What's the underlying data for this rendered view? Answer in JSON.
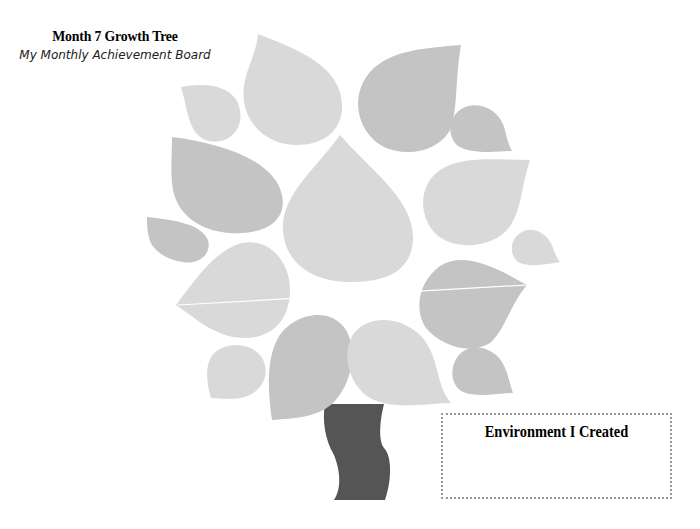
{
  "header": {
    "title": "Month 7 Growth Tree",
    "subtitle": "My Monthly Achievement Board"
  },
  "tree": {
    "leaf_colors": {
      "light": "#d9d9d9",
      "dark": "#c4c4c4"
    },
    "trunk_color": "#555555",
    "leaf_count": 17
  },
  "environment_box": {
    "title": "Environment I Created",
    "content": ""
  }
}
